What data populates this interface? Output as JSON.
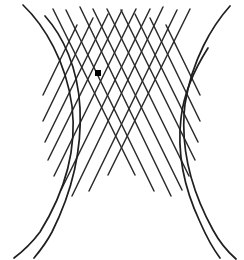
{
  "figure": {
    "canvas": {
      "width": 244,
      "height": 260,
      "background": "#ffffff"
    },
    "style": {
      "grid_stroke_color": "#2b2b2b",
      "grid_stroke_width": 1.5,
      "curve_stroke_color": "#1f1f1f",
      "curve_stroke_width": 1.7,
      "dot_color": "#000000"
    },
    "fixation_dot": {
      "name": "fixation-dot",
      "cx": 98,
      "cy": 73,
      "size": 6,
      "shape": "square"
    },
    "curves": [
      {
        "name": "left-hyperbola",
        "d": "M 23 5 C 45 26, 66 62, 72 106 C 77 148, 66 190, 40 232 C 31 244, 22 252, 14 258"
      },
      {
        "name": "left-hyperbola-inner",
        "d": "M 45 16 C 63 36, 78 68, 80 108 C 82 150, 72 192, 52 232 C 45 245, 39 252, 34 258"
      },
      {
        "name": "right-hyperbola",
        "d": "M 230 6 C 212 26, 192 60, 185 104 C 180 146, 190 188, 213 230 C 220 243, 228 252, 236 259"
      },
      {
        "name": "right-hyperbola-inner",
        "d": "M 208 48 C 194 70, 184 92, 181 118 C 177 152, 184 188, 200 222 C 207 238, 214 250, 220 258"
      }
    ],
    "grid_lines_left_family": [
      {
        "name": "grid-line-l1",
        "x1": 53,
        "y1": 9,
        "x2": 135,
        "y2": 175
      },
      {
        "name": "grid-line-l2",
        "x1": 66,
        "y1": 10,
        "x2": 154,
        "y2": 191
      },
      {
        "name": "grid-line-l3",
        "x1": 80,
        "y1": 7,
        "x2": 171,
        "y2": 196
      },
      {
        "name": "grid-line-l4",
        "x1": 93,
        "y1": 9,
        "x2": 182,
        "y2": 190
      },
      {
        "name": "grid-line-l5",
        "x1": 107,
        "y1": 9,
        "x2": 189,
        "y2": 176
      },
      {
        "name": "grid-line-l6",
        "x1": 121,
        "y1": 10,
        "x2": 195,
        "y2": 160
      },
      {
        "name": "grid-line-l7",
        "x1": 135,
        "y1": 14,
        "x2": 198,
        "y2": 142
      },
      {
        "name": "grid-line-l8",
        "x1": 150,
        "y1": 18,
        "x2": 200,
        "y2": 121
      },
      {
        "name": "grid-line-l9",
        "x1": 166,
        "y1": 25,
        "x2": 200,
        "y2": 95
      }
    ],
    "grid_lines_right_family": [
      {
        "name": "grid-line-r1",
        "x1": 190,
        "y1": 9,
        "x2": 108,
        "y2": 175
      },
      {
        "name": "grid-line-r2",
        "x1": 177,
        "y1": 10,
        "x2": 89,
        "y2": 191
      },
      {
        "name": "grid-line-r3",
        "x1": 163,
        "y1": 7,
        "x2": 72,
        "y2": 196
      },
      {
        "name": "grid-line-r4",
        "x1": 150,
        "y1": 9,
        "x2": 61,
        "y2": 190
      },
      {
        "name": "grid-line-r5",
        "x1": 136,
        "y1": 9,
        "x2": 54,
        "y2": 176
      },
      {
        "name": "grid-line-r6",
        "x1": 122,
        "y1": 10,
        "x2": 48,
        "y2": 160
      },
      {
        "name": "grid-line-r7",
        "x1": 108,
        "y1": 14,
        "x2": 45,
        "y2": 142
      },
      {
        "name": "grid-line-r8",
        "x1": 93,
        "y1": 18,
        "x2": 43,
        "y2": 121
      },
      {
        "name": "grid-line-r9",
        "x1": 77,
        "y1": 25,
        "x2": 43,
        "y2": 95
      }
    ]
  }
}
